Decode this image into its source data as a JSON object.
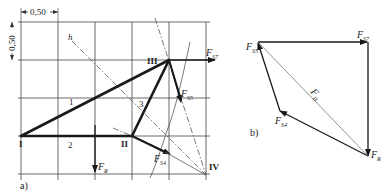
{
  "figure": {
    "part_a": {
      "label": "a)",
      "scale": {
        "horizontal": "0,50",
        "vertical": "0,50"
      },
      "nodes": [
        {
          "id": "I",
          "label": "I"
        },
        {
          "id": "II",
          "label": "II"
        },
        {
          "id": "III",
          "label": "III"
        },
        {
          "id": "IV",
          "label": "IV"
        }
      ],
      "members": [
        {
          "label": "1"
        },
        {
          "label": "2"
        },
        {
          "label": "3"
        }
      ],
      "line_label": "h",
      "forces": {
        "FR": {
          "main": "F",
          "sub": "R"
        },
        "FS4": {
          "main": "F",
          "sub": "S4"
        },
        "FS5": {
          "main": "F",
          "sub": "S5"
        },
        "FS7": {
          "main": "F",
          "sub": "S7"
        }
      }
    },
    "part_b": {
      "label": "b)",
      "forces": {
        "FS5": {
          "main": "F",
          "sub": "S5"
        },
        "FS7": {
          "main": "F",
          "sub": "S7"
        },
        "FH": {
          "main": "F",
          "sub": "H"
        },
        "FS4": {
          "main": "F",
          "sub": "S4"
        },
        "FR": {
          "main": "F",
          "sub": "R"
        }
      }
    }
  }
}
